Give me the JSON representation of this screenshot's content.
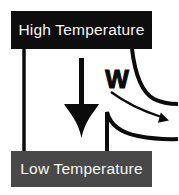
{
  "diagram": {
    "type": "heat-engine-energy-flow",
    "background": "#ffffff",
    "colors": {
      "line": "#0b0b0b",
      "high_reservoir_bg": "#0d0d0d",
      "low_reservoir_bg": "#484848",
      "reservoir_text": "#f7f7f7"
    },
    "high_reservoir": {
      "label": "High Temperature"
    },
    "low_reservoir": {
      "label": "Low Temperature"
    },
    "work": {
      "label": "W"
    },
    "icons": {
      "heat_flow": "down-arrow",
      "work_output": "curved-right-arrow"
    }
  }
}
